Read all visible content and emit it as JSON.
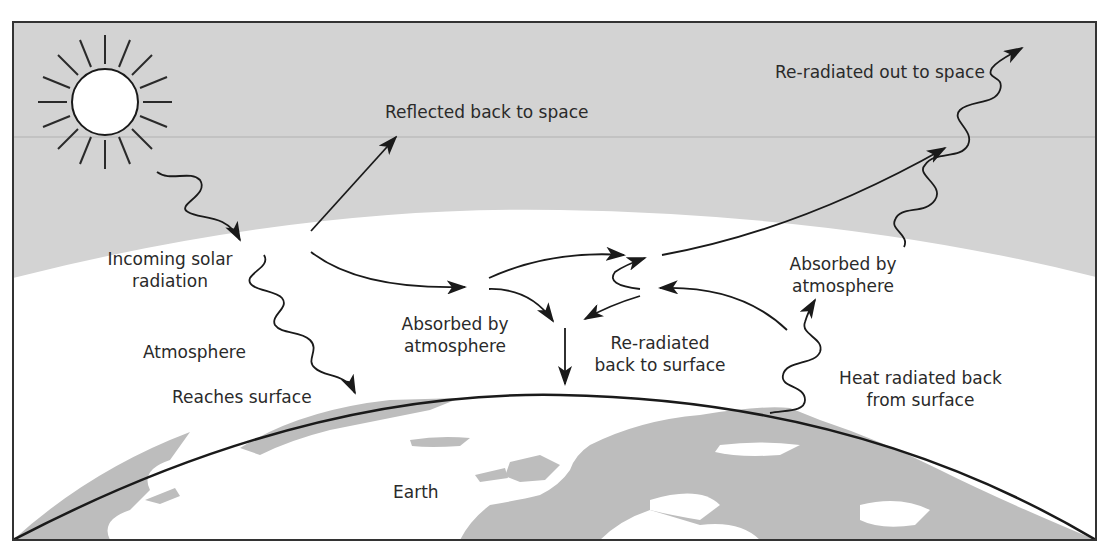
{
  "diagram": {
    "colors": {
      "space": "#d3d3d3",
      "atmosphere": "#ffffff",
      "land": "#bdbdbd",
      "line": "#1a1a1a",
      "border": "#333333"
    },
    "labels": {
      "reflected": "Reflected back to space",
      "reradiated_out": "Re-radiated out to space",
      "incoming": [
        "Incoming solar",
        "radiation"
      ],
      "atmosphere": "Atmosphere",
      "reaches_surface": "Reaches surface",
      "absorbed_center": [
        "Absorbed by",
        "atmosphere"
      ],
      "reradiated_back": [
        "Re-radiated",
        "back to surface"
      ],
      "absorbed_right": [
        "Absorbed by",
        "atmosphere"
      ],
      "heat_radiated": [
        "Heat radiated back",
        "from surface"
      ],
      "earth": "Earth"
    },
    "icons": {
      "sun": "sun-icon",
      "straight_arrow": "arrow-icon",
      "wavy_arrow": "wavy-arrow-icon"
    }
  }
}
